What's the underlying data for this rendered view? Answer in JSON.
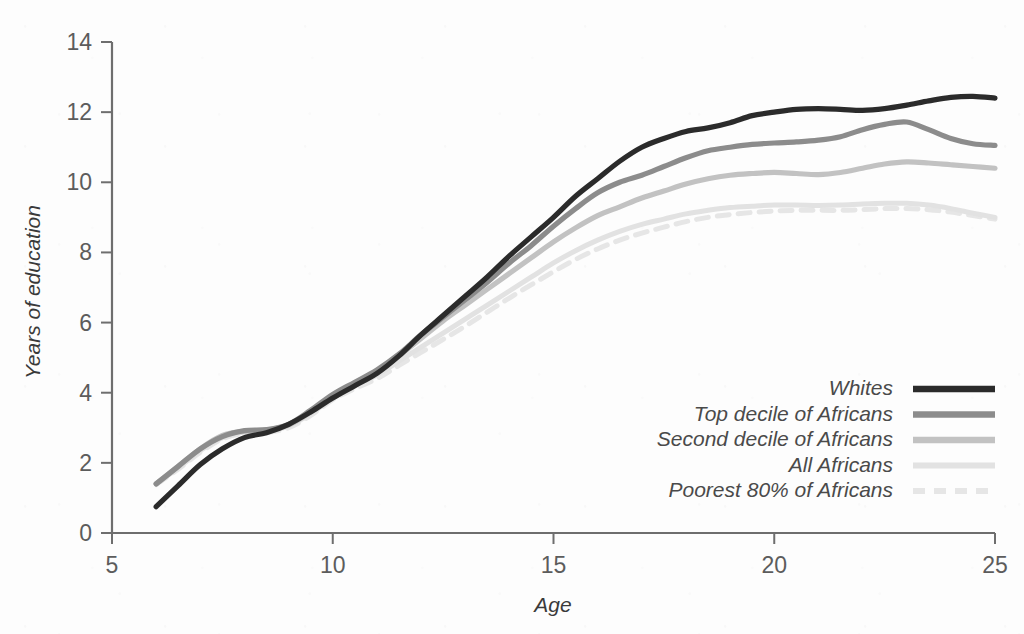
{
  "chart_data": {
    "type": "line",
    "title": "",
    "xlabel": "Age",
    "ylabel": "Years of education",
    "xlim": [
      5,
      25
    ],
    "ylim": [
      0,
      14
    ],
    "xticks": [
      "5",
      "10",
      "15",
      "20",
      "25"
    ],
    "yticks": [
      "0",
      "2",
      "4",
      "6",
      "8",
      "10",
      "12",
      "14"
    ],
    "grid": false,
    "legend_position": "bottom-right",
    "x": [
      6,
      6.5,
      7,
      7.5,
      8,
      8.5,
      9,
      9.5,
      10,
      10.5,
      11,
      11.5,
      12,
      12.5,
      13,
      13.5,
      14,
      14.5,
      15,
      15.5,
      16,
      16.5,
      17,
      17.5,
      18,
      18.5,
      19,
      19.5,
      20,
      20.5,
      21,
      21.5,
      22,
      22.5,
      23,
      23.5,
      24,
      24.5,
      25
    ],
    "series": [
      {
        "name": "Whites",
        "color": "#2b2b2b",
        "width": 5.2,
        "dash": "none",
        "values": [
          0.75,
          1.35,
          1.95,
          2.4,
          2.72,
          2.86,
          3.1,
          3.45,
          3.85,
          4.2,
          4.55,
          5.05,
          5.65,
          6.2,
          6.75,
          7.3,
          7.9,
          8.45,
          9.0,
          9.6,
          10.1,
          10.6,
          11.0,
          11.25,
          11.45,
          11.55,
          11.7,
          11.9,
          12.0,
          12.08,
          12.1,
          12.08,
          12.05,
          12.1,
          12.2,
          12.32,
          12.42,
          12.45,
          12.4
        ]
      },
      {
        "name": "Top decile of Africans",
        "color": "#8c8c8c",
        "width": 5.2,
        "dash": "none",
        "values": [
          1.4,
          1.9,
          2.4,
          2.75,
          2.92,
          2.95,
          3.1,
          3.5,
          3.95,
          4.3,
          4.65,
          5.1,
          5.65,
          6.15,
          6.65,
          7.15,
          7.7,
          8.2,
          8.75,
          9.25,
          9.7,
          10.0,
          10.2,
          10.45,
          10.7,
          10.9,
          11.0,
          11.08,
          11.12,
          11.15,
          11.2,
          11.3,
          11.5,
          11.65,
          11.72,
          11.5,
          11.25,
          11.1,
          11.05
        ]
      },
      {
        "name": "Second decile of Africans",
        "color": "#c2c2c2",
        "width": 5.2,
        "dash": "none",
        "values": [
          1.4,
          1.9,
          2.4,
          2.78,
          2.9,
          2.93,
          3.08,
          3.45,
          3.9,
          4.25,
          4.6,
          5.05,
          5.55,
          6.05,
          6.5,
          6.95,
          7.4,
          7.85,
          8.3,
          8.7,
          9.05,
          9.3,
          9.55,
          9.75,
          9.95,
          10.1,
          10.2,
          10.25,
          10.28,
          10.25,
          10.22,
          10.28,
          10.4,
          10.52,
          10.58,
          10.55,
          10.5,
          10.45,
          10.4
        ]
      },
      {
        "name": "All Africans",
        "color": "#e2e2e2",
        "width": 5.0,
        "dash": "none",
        "values": [
          1.4,
          1.85,
          2.35,
          2.72,
          2.88,
          2.9,
          3.05,
          3.4,
          3.85,
          4.2,
          4.5,
          4.9,
          5.3,
          5.7,
          6.1,
          6.5,
          6.9,
          7.3,
          7.7,
          8.05,
          8.35,
          8.6,
          8.8,
          8.95,
          9.1,
          9.2,
          9.28,
          9.32,
          9.35,
          9.35,
          9.34,
          9.35,
          9.38,
          9.4,
          9.4,
          9.35,
          9.25,
          9.12,
          9.0
        ]
      },
      {
        "name": "Poorest 80% of Africans",
        "color": "#e6e6e6",
        "width": 5.0,
        "dash": "12 9",
        "values": [
          1.38,
          1.82,
          2.3,
          2.68,
          2.84,
          2.86,
          3.0,
          3.35,
          3.8,
          4.12,
          4.4,
          4.78,
          5.15,
          5.52,
          5.9,
          6.3,
          6.7,
          7.08,
          7.45,
          7.8,
          8.1,
          8.35,
          8.55,
          8.72,
          8.88,
          9.0,
          9.08,
          9.14,
          9.18,
          9.2,
          9.2,
          9.2,
          9.22,
          9.25,
          9.25,
          9.22,
          9.15,
          9.05,
          8.95
        ]
      }
    ]
  }
}
